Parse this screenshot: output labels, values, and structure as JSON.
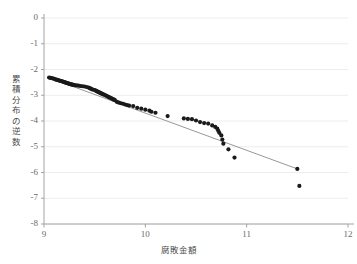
{
  "chart_data": {
    "type": "scatter",
    "title": "",
    "xlabel": "腐敗金額",
    "ylabel": "累積分布の逆数",
    "xlim": [
      9,
      12
    ],
    "ylim": [
      -8,
      0
    ],
    "xticks": [
      "9",
      "10",
      "11",
      "12"
    ],
    "xtick_values": [
      9,
      10,
      11,
      12
    ],
    "yticks": [
      "0",
      "-1",
      "-2",
      "-3",
      "-4",
      "-5",
      "-6",
      "-7",
      "-8"
    ],
    "ytick_values": [
      0,
      -1,
      -2,
      -3,
      -4,
      -5,
      -6,
      -7,
      -8
    ],
    "grid": "horizontal",
    "legend": "none",
    "marker_color": "#1a1a1a",
    "line_color": "#8c8c8c",
    "grid_color": "#e8e8e8",
    "axis_color": "#9a9a9a",
    "series": [
      {
        "name": "観測値",
        "type": "scatter",
        "points": [
          [
            9.05,
            -2.31
          ],
          [
            9.06,
            -2.32
          ],
          [
            9.07,
            -2.33
          ],
          [
            9.08,
            -2.34
          ],
          [
            9.09,
            -2.35
          ],
          [
            9.1,
            -2.36
          ],
          [
            9.11,
            -2.38
          ],
          [
            9.12,
            -2.39
          ],
          [
            9.13,
            -2.4
          ],
          [
            9.14,
            -2.41
          ],
          [
            9.15,
            -2.43
          ],
          [
            9.16,
            -2.44
          ],
          [
            9.17,
            -2.45
          ],
          [
            9.18,
            -2.46
          ],
          [
            9.19,
            -2.48
          ],
          [
            9.2,
            -2.49
          ],
          [
            9.21,
            -2.5
          ],
          [
            9.22,
            -2.52
          ],
          [
            9.23,
            -2.53
          ],
          [
            9.24,
            -2.54
          ],
          [
            9.25,
            -2.56
          ],
          [
            9.26,
            -2.57
          ],
          [
            9.27,
            -2.58
          ],
          [
            9.28,
            -2.59
          ],
          [
            9.29,
            -2.6
          ],
          [
            9.3,
            -2.61
          ],
          [
            9.32,
            -2.62
          ],
          [
            9.34,
            -2.63
          ],
          [
            9.36,
            -2.64
          ],
          [
            9.38,
            -2.65
          ],
          [
            9.4,
            -2.66
          ],
          [
            9.42,
            -2.68
          ],
          [
            9.44,
            -2.7
          ],
          [
            9.45,
            -2.72
          ],
          [
            9.46,
            -2.74
          ],
          [
            9.47,
            -2.76
          ],
          [
            9.48,
            -2.78
          ],
          [
            9.5,
            -2.8
          ],
          [
            9.51,
            -2.82
          ],
          [
            9.52,
            -2.84
          ],
          [
            9.53,
            -2.86
          ],
          [
            9.54,
            -2.88
          ],
          [
            9.55,
            -2.9
          ],
          [
            9.56,
            -2.92
          ],
          [
            9.57,
            -2.94
          ],
          [
            9.58,
            -2.96
          ],
          [
            9.59,
            -2.97
          ],
          [
            9.6,
            -2.99
          ],
          [
            9.61,
            -3.01
          ],
          [
            9.62,
            -3.03
          ],
          [
            9.63,
            -3.05
          ],
          [
            9.64,
            -3.07
          ],
          [
            9.65,
            -3.09
          ],
          [
            9.66,
            -3.11
          ],
          [
            9.67,
            -3.13
          ],
          [
            9.68,
            -3.15
          ],
          [
            9.69,
            -3.17
          ],
          [
            9.7,
            -3.19
          ],
          [
            9.72,
            -3.26
          ],
          [
            9.74,
            -3.29
          ],
          [
            9.76,
            -3.31
          ],
          [
            9.78,
            -3.33
          ],
          [
            9.8,
            -3.36
          ],
          [
            9.82,
            -3.38
          ],
          [
            9.84,
            -3.4
          ],
          [
            9.88,
            -3.42
          ],
          [
            9.92,
            -3.49
          ],
          [
            9.96,
            -3.52
          ],
          [
            10.0,
            -3.56
          ],
          [
            10.04,
            -3.6
          ],
          [
            10.06,
            -3.64
          ],
          [
            10.1,
            -3.68
          ],
          [
            10.22,
            -3.81
          ],
          [
            10.38,
            -3.9
          ],
          [
            10.42,
            -3.92
          ],
          [
            10.46,
            -3.93
          ],
          [
            10.5,
            -3.98
          ],
          [
            10.54,
            -4.04
          ],
          [
            10.58,
            -4.08
          ],
          [
            10.62,
            -4.1
          ],
          [
            10.66,
            -4.17
          ],
          [
            10.69,
            -4.23
          ],
          [
            10.71,
            -4.3
          ],
          [
            10.72,
            -4.38
          ],
          [
            10.73,
            -4.46
          ],
          [
            10.75,
            -4.56
          ],
          [
            10.76,
            -4.72
          ],
          [
            10.77,
            -4.88
          ],
          [
            10.82,
            -5.1
          ],
          [
            10.88,
            -5.42
          ],
          [
            11.5,
            -5.86
          ],
          [
            11.52,
            -6.52
          ]
        ]
      },
      {
        "name": "回帰直線",
        "type": "line",
        "points": [
          [
            9.05,
            -2.32
          ],
          [
            11.5,
            -5.86
          ]
        ]
      }
    ]
  }
}
